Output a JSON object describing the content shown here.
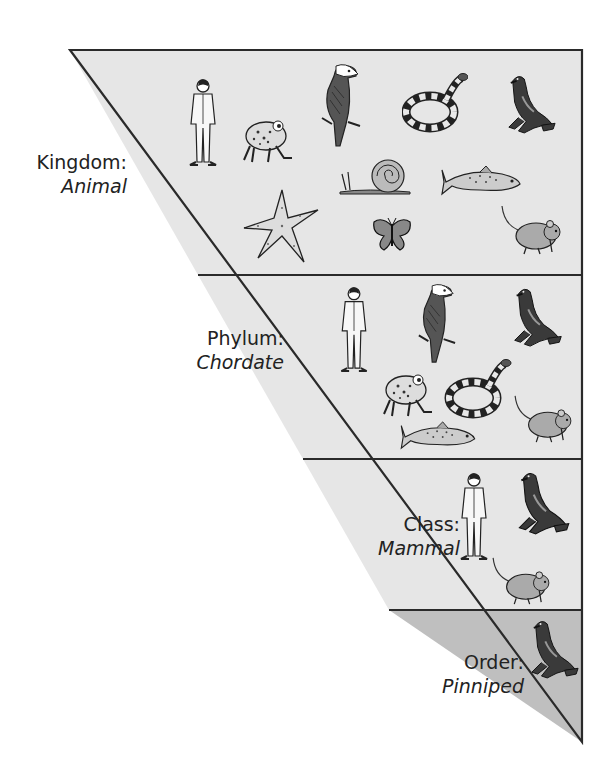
{
  "diagram": {
    "type": "taxonomy-funnel",
    "geometry": {
      "top_y": 50,
      "left_x": 70,
      "right_x": 582,
      "tip_y": 742,
      "dividers_y": [
        275,
        459,
        610
      ]
    },
    "colors": {
      "outline": "#2a2a2a",
      "band_light": "#e6e6e6",
      "band_order": "#bfbfbf",
      "ink": "#222222"
    },
    "levels": [
      {
        "rank": "Kingdom:",
        "taxon": "Animal",
        "label_pos": {
          "right": 485,
          "top": 150
        },
        "animals": [
          {
            "name": "human",
            "x": 185,
            "y": 78,
            "w": 36,
            "h": 88
          },
          {
            "name": "frog",
            "x": 240,
            "y": 112,
            "w": 54,
            "h": 52
          },
          {
            "name": "eagle",
            "x": 318,
            "y": 62,
            "w": 44,
            "h": 86
          },
          {
            "name": "snake",
            "x": 402,
            "y": 70,
            "w": 66,
            "h": 64
          },
          {
            "name": "sea-lion",
            "x": 505,
            "y": 72,
            "w": 52,
            "h": 66
          },
          {
            "name": "snail",
            "x": 336,
            "y": 158,
            "w": 78,
            "h": 38
          },
          {
            "name": "trout",
            "x": 440,
            "y": 164,
            "w": 82,
            "h": 34
          },
          {
            "name": "starfish",
            "x": 242,
            "y": 188,
            "w": 78,
            "h": 76
          },
          {
            "name": "butterfly",
            "x": 372,
            "y": 216,
            "w": 40,
            "h": 36
          },
          {
            "name": "mouse",
            "x": 500,
            "y": 204,
            "w": 62,
            "h": 52
          }
        ]
      },
      {
        "rank": "Phylum:",
        "taxon": "Chordate",
        "label_pos": {
          "right": 328,
          "top": 326
        },
        "animals": [
          {
            "name": "human",
            "x": 336,
            "y": 286,
            "w": 36,
            "h": 86
          },
          {
            "name": "eagle",
            "x": 414,
            "y": 282,
            "w": 44,
            "h": 82
          },
          {
            "name": "sea-lion",
            "x": 510,
            "y": 286,
            "w": 54,
            "h": 64
          },
          {
            "name": "frog",
            "x": 380,
            "y": 366,
            "w": 54,
            "h": 52
          },
          {
            "name": "snake",
            "x": 444,
            "y": 356,
            "w": 68,
            "h": 64
          },
          {
            "name": "mouse",
            "x": 512,
            "y": 394,
            "w": 62,
            "h": 50
          },
          {
            "name": "trout",
            "x": 398,
            "y": 420,
            "w": 80,
            "h": 32
          }
        ]
      },
      {
        "rank": "Class:",
        "taxon": "Mammal",
        "label_pos": {
          "right": 152,
          "top": 512
        },
        "animals": [
          {
            "name": "human",
            "x": 456,
            "y": 466,
            "w": 36,
            "h": 100
          },
          {
            "name": "sea-lion",
            "x": 514,
            "y": 470,
            "w": 58,
            "h": 68
          },
          {
            "name": "mouse",
            "x": 488,
            "y": 556,
            "w": 66,
            "h": 50
          }
        ]
      },
      {
        "rank": "Order:",
        "taxon": "Pinniped",
        "label_pos": {
          "right": 88,
          "top": 650
        },
        "animals": [
          {
            "name": "sea-lion",
            "x": 528,
            "y": 616,
            "w": 52,
            "h": 68
          }
        ]
      }
    ]
  }
}
